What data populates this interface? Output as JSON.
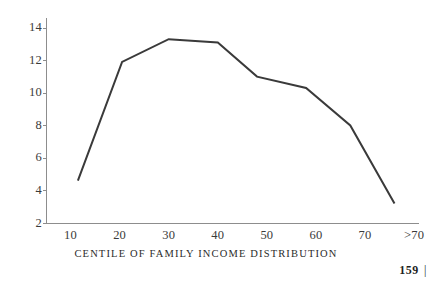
{
  "chart_data": {
    "type": "line",
    "title": "",
    "xlabel": "CENTILE OF FAMILY INCOME DISTRIBUTION",
    "ylabel": "",
    "xlim": [
      5,
      81
    ],
    "ylim": [
      2,
      14.6
    ],
    "grid": false,
    "legend": null,
    "xtick_labels": [
      "10",
      "20",
      "30",
      "40",
      "50",
      "60",
      "70",
      ">70"
    ],
    "xtick_values": [
      10,
      20,
      30,
      40,
      50,
      60,
      70,
      80
    ],
    "ytick_labels": [
      "2",
      "4",
      "6",
      "8",
      "10",
      "12",
      "14"
    ],
    "ytick_values": [
      2,
      4,
      6,
      8,
      10,
      12,
      14
    ],
    "x": [
      11.5,
      20.5,
      30,
      40,
      48,
      58,
      67,
      76
    ],
    "values": [
      4.6,
      11.9,
      13.3,
      13.1,
      11.0,
      10.3,
      8.0,
      3.2
    ],
    "series": [
      {
        "name": "Centile share",
        "x": [
          11.5,
          20.5,
          30,
          40,
          48,
          58,
          67,
          76
        ],
        "values": [
          4.6,
          11.9,
          13.3,
          13.1,
          11.0,
          10.3,
          8.0,
          3.2
        ]
      }
    ],
    "line_color": "#3a3a3a",
    "axis_color": "#8d8d8d"
  },
  "page": {
    "folio_number": "159",
    "folio_rule": "|"
  }
}
